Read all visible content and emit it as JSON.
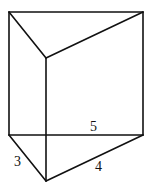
{
  "diagram": {
    "type": "triangular-prism",
    "stroke_color": "#111111",
    "background": "#ffffff",
    "vertices": {
      "top_left": [
        9,
        12
      ],
      "top_right": [
        143,
        12
      ],
      "top_front": [
        46,
        58
      ],
      "bottom_left": [
        9,
        135
      ],
      "bottom_right": [
        143,
        135
      ],
      "bottom_front": [
        46,
        181
      ]
    },
    "labels": {
      "back_edge": "5",
      "left_edge": "3",
      "right_edge": "4"
    }
  }
}
